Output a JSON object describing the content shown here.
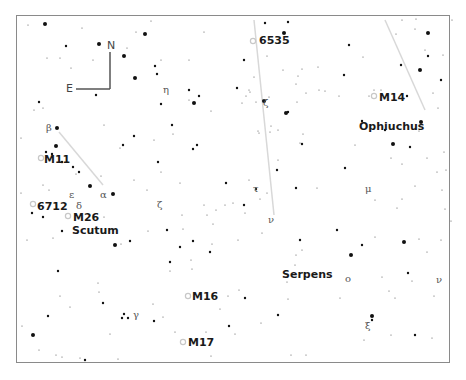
{
  "map": {
    "title": "Star chart: Scutum / Serpens / Ophiuchus region",
    "frame": {
      "x": 16,
      "y": 15,
      "w": 434,
      "h": 348,
      "color": "#8a8a8a"
    },
    "compass": {
      "north": "N",
      "east": "E",
      "corner_x": 110,
      "corner_y": 89,
      "n_top_y": 52,
      "e_left_x": 76
    },
    "constellations": [
      {
        "name": "Ophiuchus",
        "x": 359,
        "y": 121
      },
      {
        "name": "Serpens",
        "x": 282,
        "y": 269
      },
      {
        "name": "Scutum",
        "x": 72,
        "y": 225
      }
    ],
    "deep_sky": [
      {
        "name": "6535",
        "x": 259,
        "y": 35,
        "mx": 253,
        "my": 41
      },
      {
        "name": "M14",
        "x": 379,
        "y": 92,
        "mx": 374,
        "my": 96
      },
      {
        "name": "M11",
        "x": 44,
        "y": 154,
        "mx": 41,
        "my": 158
      },
      {
        "name": "6712",
        "x": 37,
        "y": 201,
        "mx": 33,
        "my": 204
      },
      {
        "name": "M26",
        "x": 73,
        "y": 212,
        "mx": 68,
        "my": 216
      },
      {
        "name": "M16",
        "x": 192,
        "y": 291,
        "mx": 188,
        "my": 296
      },
      {
        "name": "M17",
        "x": 188,
        "y": 337,
        "mx": 183,
        "my": 342
      }
    ],
    "greek_labels": [
      {
        "symbol": "η",
        "x": 163,
        "y": 85
      },
      {
        "symbol": "ζ",
        "x": 263,
        "y": 98
      },
      {
        "symbol": "β",
        "x": 46,
        "y": 123
      },
      {
        "symbol": "ε",
        "x": 69,
        "y": 190
      },
      {
        "symbol": "α",
        "x": 100,
        "y": 190
      },
      {
        "symbol": "δ",
        "x": 76,
        "y": 201
      },
      {
        "symbol": "ζ",
        "x": 157,
        "y": 200
      },
      {
        "symbol": "τ",
        "x": 253,
        "y": 184
      },
      {
        "symbol": "ν",
        "x": 268,
        "y": 215
      },
      {
        "symbol": "μ",
        "x": 365,
        "y": 184
      },
      {
        "symbol": "ο",
        "x": 345,
        "y": 274
      },
      {
        "symbol": "ν",
        "x": 436,
        "y": 275
      },
      {
        "symbol": "ξ",
        "x": 365,
        "y": 321
      },
      {
        "symbol": "γ",
        "x": 133,
        "y": 310
      }
    ],
    "boundaries": [
      {
        "x1": 254,
        "y1": 20,
        "x2": 274,
        "y2": 215
      },
      {
        "x1": 385,
        "y1": 20,
        "x2": 425,
        "y2": 110
      },
      {
        "x1": 59,
        "y1": 132,
        "x2": 103,
        "y2": 185
      }
    ],
    "stars": [
      [
        45,
        24,
        3
      ],
      [
        28,
        25,
        1
      ],
      [
        151,
        21,
        1
      ],
      [
        145,
        34,
        3
      ],
      [
        82,
        28,
        1
      ],
      [
        136,
        32,
        1
      ],
      [
        204,
        32,
        1
      ],
      [
        99,
        44,
        3
      ],
      [
        124,
        56,
        3
      ],
      [
        66,
        46,
        2
      ],
      [
        127,
        48,
        1
      ],
      [
        60,
        58,
        1
      ],
      [
        93,
        60,
        1
      ],
      [
        47,
        58,
        1
      ],
      [
        71,
        68,
        1
      ],
      [
        135,
        78,
        3
      ],
      [
        96,
        95,
        2
      ],
      [
        155,
        66,
        2
      ],
      [
        161,
        60,
        1
      ],
      [
        189,
        60,
        1
      ],
      [
        157,
        74,
        2
      ],
      [
        189,
        90,
        2
      ],
      [
        199,
        96,
        2
      ],
      [
        194,
        103,
        3
      ],
      [
        161,
        104,
        2
      ],
      [
        211,
        111,
        1
      ],
      [
        197,
        145,
        2
      ],
      [
        172,
        125,
        2
      ],
      [
        173,
        134,
        1
      ],
      [
        104,
        125,
        1
      ],
      [
        120,
        148,
        1
      ],
      [
        123,
        145,
        2
      ],
      [
        134,
        136,
        2
      ],
      [
        39,
        102,
        2
      ],
      [
        43,
        108,
        1
      ],
      [
        34,
        110,
        1
      ],
      [
        21,
        138,
        1
      ],
      [
        57,
        128,
        3
      ],
      [
        56,
        146,
        3
      ],
      [
        46,
        152,
        2
      ],
      [
        52,
        154,
        2
      ],
      [
        62,
        162,
        2
      ],
      [
        73,
        167,
        2
      ],
      [
        79,
        172,
        2
      ],
      [
        90,
        186,
        3
      ],
      [
        101,
        176,
        1
      ],
      [
        113,
        194,
        3
      ],
      [
        76,
        174,
        1
      ],
      [
        158,
        162,
        2
      ],
      [
        161,
        172,
        1
      ],
      [
        180,
        183,
        1
      ],
      [
        43,
        185,
        1
      ],
      [
        49,
        190,
        1
      ],
      [
        21,
        193,
        1
      ],
      [
        32,
        213,
        2
      ],
      [
        43,
        217,
        2
      ],
      [
        62,
        231,
        2
      ],
      [
        27,
        240,
        1
      ],
      [
        53,
        238,
        1
      ],
      [
        115,
        245,
        3
      ],
      [
        130,
        241,
        2
      ],
      [
        167,
        230,
        2
      ],
      [
        193,
        241,
        2
      ],
      [
        216,
        210,
        1
      ],
      [
        226,
        183,
        2
      ],
      [
        233,
        203,
        1
      ],
      [
        182,
        215,
        1
      ],
      [
        183,
        229,
        1
      ],
      [
        170,
        262,
        2
      ],
      [
        170,
        271,
        1
      ],
      [
        191,
        260,
        1
      ],
      [
        192,
        269,
        1
      ],
      [
        58,
        271,
        2
      ],
      [
        98,
        283,
        1
      ],
      [
        60,
        296,
        1
      ],
      [
        70,
        307,
        1
      ],
      [
        48,
        316,
        2
      ],
      [
        22,
        326,
        1
      ],
      [
        33,
        335,
        3
      ],
      [
        39,
        350,
        1
      ],
      [
        56,
        355,
        1
      ],
      [
        62,
        357,
        1
      ],
      [
        80,
        358,
        1
      ],
      [
        85,
        360,
        2
      ],
      [
        118,
        359,
        1
      ],
      [
        99,
        292,
        1
      ],
      [
        103,
        303,
        2
      ],
      [
        124,
        314,
        2
      ],
      [
        122,
        318,
        2
      ],
      [
        128,
        318,
        2
      ],
      [
        110,
        334,
        1
      ],
      [
        153,
        304,
        1
      ],
      [
        154,
        321,
        2
      ],
      [
        175,
        332,
        1
      ],
      [
        206,
        332,
        1
      ],
      [
        211,
        356,
        1
      ],
      [
        229,
        326,
        2
      ],
      [
        235,
        334,
        1
      ],
      [
        220,
        309,
        1
      ],
      [
        163,
        317,
        1
      ],
      [
        245,
        298,
        2
      ],
      [
        261,
        323,
        1
      ],
      [
        228,
        296,
        1
      ],
      [
        189,
        100,
        1
      ],
      [
        246,
        96,
        1
      ],
      [
        256,
        102,
        1
      ],
      [
        258,
        131,
        1
      ],
      [
        264,
        101,
        3
      ],
      [
        286,
        113,
        3
      ],
      [
        303,
        134,
        1
      ],
      [
        302,
        144,
        2
      ],
      [
        277,
        170,
        2
      ],
      [
        278,
        160,
        1
      ],
      [
        256,
        189,
        2
      ],
      [
        267,
        193,
        1
      ],
      [
        296,
        188,
        2
      ],
      [
        317,
        188,
        1
      ],
      [
        300,
        240,
        2
      ],
      [
        302,
        250,
        1
      ],
      [
        296,
        255,
        1
      ],
      [
        295,
        265,
        1
      ],
      [
        262,
        233,
        1
      ],
      [
        239,
        290,
        1
      ],
      [
        287,
        282,
        1
      ],
      [
        278,
        315,
        2
      ],
      [
        291,
        355,
        1
      ],
      [
        306,
        355,
        1
      ],
      [
        288,
        299,
        1
      ],
      [
        337,
        230,
        2
      ],
      [
        351,
        255,
        3
      ],
      [
        375,
        237,
        1
      ],
      [
        362,
        245,
        2
      ],
      [
        404,
        242,
        3
      ],
      [
        419,
        239,
        1
      ],
      [
        408,
        273,
        2
      ],
      [
        389,
        291,
        1
      ],
      [
        395,
        298,
        1
      ],
      [
        372,
        316,
        3
      ],
      [
        372,
        320,
        2
      ],
      [
        364,
        340,
        1
      ],
      [
        391,
        335,
        1
      ],
      [
        415,
        335,
        2
      ],
      [
        432,
        338,
        1
      ],
      [
        434,
        296,
        1
      ],
      [
        427,
        252,
        1
      ],
      [
        441,
        240,
        1
      ],
      [
        412,
        281,
        1
      ],
      [
        382,
        277,
        1
      ],
      [
        340,
        298,
        1
      ],
      [
        421,
        122,
        3
      ],
      [
        419,
        131,
        1
      ],
      [
        393,
        144,
        3
      ],
      [
        410,
        147,
        2
      ],
      [
        391,
        158,
        1
      ],
      [
        427,
        158,
        1
      ],
      [
        402,
        164,
        1
      ],
      [
        355,
        145,
        1
      ],
      [
        345,
        168,
        2
      ],
      [
        385,
        130,
        2
      ],
      [
        420,
        70,
        3
      ],
      [
        425,
        50,
        1
      ],
      [
        428,
        56,
        2
      ],
      [
        401,
        65,
        2
      ],
      [
        441,
        80,
        2
      ],
      [
        362,
        121,
        2
      ],
      [
        344,
        75,
        2
      ],
      [
        339,
        96,
        1
      ],
      [
        407,
        96,
        2
      ],
      [
        369,
        96,
        1
      ],
      [
        374,
        90,
        1
      ],
      [
        381,
        90,
        1
      ],
      [
        288,
        112,
        2
      ],
      [
        296,
        84,
        1
      ],
      [
        325,
        91,
        1
      ],
      [
        319,
        90,
        1
      ],
      [
        250,
        92,
        1
      ],
      [
        237,
        88,
        2
      ],
      [
        270,
        132,
        1
      ],
      [
        249,
        90,
        1
      ],
      [
        242,
        103,
        1
      ],
      [
        267,
        56,
        1
      ],
      [
        283,
        70,
        1
      ],
      [
        302,
        69,
        1
      ],
      [
        298,
        76,
        1
      ],
      [
        318,
        67,
        1
      ],
      [
        349,
        45,
        2
      ],
      [
        363,
        57,
        1
      ],
      [
        396,
        34,
        1
      ],
      [
        402,
        20,
        1
      ],
      [
        416,
        19,
        1
      ],
      [
        415,
        29,
        1
      ],
      [
        428,
        33,
        3
      ],
      [
        452,
        20,
        1
      ],
      [
        443,
        55,
        1
      ],
      [
        433,
        93,
        1
      ],
      [
        438,
        108,
        1
      ],
      [
        444,
        152,
        1
      ],
      [
        446,
        170,
        1
      ],
      [
        437,
        172,
        1
      ],
      [
        451,
        221,
        1
      ],
      [
        375,
        200,
        1
      ],
      [
        397,
        208,
        1
      ],
      [
        402,
        199,
        1
      ],
      [
        415,
        186,
        1
      ],
      [
        442,
        190,
        1
      ],
      [
        445,
        209,
        1
      ],
      [
        244,
        60,
        2
      ],
      [
        254,
        77,
        1
      ],
      [
        269,
        97,
        1
      ],
      [
        271,
        126,
        1
      ],
      [
        278,
        130,
        1
      ],
      [
        259,
        133,
        1
      ],
      [
        300,
        143,
        1
      ],
      [
        297,
        102,
        1
      ],
      [
        306,
        93,
        1
      ],
      [
        265,
        23,
        2
      ],
      [
        288,
        22,
        2
      ],
      [
        284,
        33,
        3
      ],
      [
        193,
        149,
        2
      ],
      [
        154,
        140,
        1
      ],
      [
        134,
        180,
        1
      ],
      [
        147,
        190,
        1
      ],
      [
        104,
        217,
        1
      ],
      [
        121,
        244,
        1
      ],
      [
        148,
        231,
        1
      ],
      [
        210,
        252,
        2
      ],
      [
        225,
        205,
        1
      ],
      [
        245,
        213,
        1
      ],
      [
        244,
        205,
        2
      ],
      [
        249,
        180,
        1
      ],
      [
        255,
        190,
        1
      ],
      [
        260,
        199,
        1
      ],
      [
        204,
        205,
        1
      ],
      [
        180,
        247,
        2
      ],
      [
        207,
        215,
        1
      ],
      [
        213,
        224,
        1
      ],
      [
        238,
        240,
        1
      ],
      [
        212,
        244,
        1
      ]
    ]
  }
}
